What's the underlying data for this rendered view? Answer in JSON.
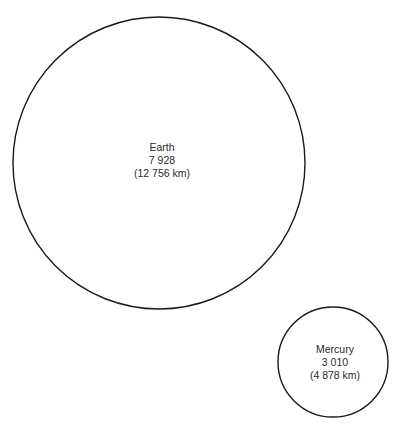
{
  "diagram": {
    "type": "size-comparison",
    "planets": [
      {
        "name": "Earth",
        "diameter_miles": "7 928",
        "diameter_km": "(12 756 km)",
        "cx": 159,
        "cy": 163,
        "r": 146
      },
      {
        "name": "Mercury",
        "diameter_miles": "3 010",
        "diameter_km": "(4 878 km)",
        "cx": 333,
        "cy": 362,
        "r": 55
      }
    ],
    "colors": {
      "stroke": "#1a1a1a",
      "text": "#2a2a2a",
      "background": "#ffffff"
    }
  }
}
